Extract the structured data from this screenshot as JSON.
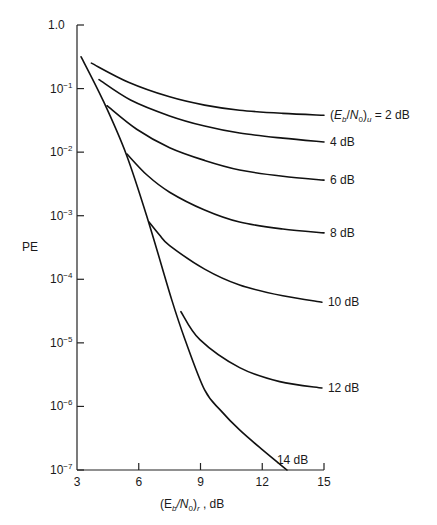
{
  "chart_data": {
    "type": "line",
    "title": "",
    "xlabel": "(E_b/N_0)_r , dB",
    "ylabel": "PE",
    "xlim": [
      3,
      15
    ],
    "ylim": [
      1e-07,
      1.0
    ],
    "yscale": "log",
    "grid": false,
    "legend_position": "inline labels at right end of curves",
    "x_ticks": [
      3,
      6,
      9,
      12,
      15
    ],
    "y_ticks": [
      {
        "value": 1.0,
        "label": "1.0"
      },
      {
        "value": 0.1,
        "label": "10",
        "exp": "−1"
      },
      {
        "value": 0.01,
        "label": "10",
        "exp": "−2"
      },
      {
        "value": 0.001,
        "label": "10",
        "exp": "−3"
      },
      {
        "value": 0.0001,
        "label": "10",
        "exp": "−4"
      },
      {
        "value": 1e-05,
        "label": "10",
        "exp": "−5"
      },
      {
        "value": 1e-06,
        "label": "10",
        "exp": "−6"
      },
      {
        "value": 1e-07,
        "label": "10",
        "exp": "−7"
      }
    ],
    "series": [
      {
        "name": "14 dB",
        "label": "14 dB",
        "label_pos": "above-end",
        "x": [
          3.2,
          4.3,
          5.4,
          6.45,
          7.6,
          8.25,
          9.2,
          10.0,
          10.9,
          12.0,
          13.2
        ],
        "log10_y": [
          -0.5,
          -1.21,
          -2.04,
          -3.07,
          -4.32,
          -4.95,
          -5.74,
          -6.07,
          -6.37,
          -6.68,
          -7.0
        ]
      },
      {
        "name": "2 dB",
        "label": "(E_b/N_0)_u = 2 dB",
        "label_pos": "right",
        "x": [
          3.7,
          5.5,
          7.5,
          9.2,
          10.9,
          13.0,
          15.0
        ],
        "log10_y": [
          -0.6,
          -0.9,
          -1.13,
          -1.26,
          -1.34,
          -1.39,
          -1.42
        ]
      },
      {
        "name": "4 dB",
        "label": "4 dB",
        "label_pos": "right",
        "x": [
          4.07,
          5.6,
          7.5,
          9.2,
          10.9,
          13.0,
          15.0
        ],
        "log10_y": [
          -0.86,
          -1.18,
          -1.43,
          -1.59,
          -1.7,
          -1.78,
          -1.84
        ]
      },
      {
        "name": "6 dB",
        "label": "6 dB",
        "label_pos": "right",
        "x": [
          4.46,
          5.9,
          7.5,
          9.2,
          10.9,
          13.0,
          15.0
        ],
        "log10_y": [
          -1.27,
          -1.64,
          -1.93,
          -2.13,
          -2.28,
          -2.38,
          -2.44
        ]
      },
      {
        "name": "8 dB",
        "label": "8 dB",
        "label_pos": "right",
        "x": [
          5.43,
          6.4,
          7.5,
          9.2,
          10.9,
          13.0,
          15.0
        ],
        "log10_y": [
          -2.03,
          -2.36,
          -2.63,
          -2.91,
          -3.1,
          -3.21,
          -3.27
        ]
      },
      {
        "name": "10 dB",
        "label": "10 dB",
        "label_pos": "right",
        "x": [
          6.5,
          7.0,
          7.5,
          9.2,
          10.9,
          13.0,
          14.9
        ],
        "log10_y": [
          -3.1,
          -3.3,
          -3.47,
          -3.84,
          -4.09,
          -4.26,
          -4.36
        ]
      },
      {
        "name": "12 dB",
        "label": "12 dB",
        "label_pos": "right",
        "x": [
          8.05,
          8.97,
          10.9,
          12.85,
          14.9
        ],
        "log10_y": [
          -4.51,
          -4.95,
          -5.39,
          -5.61,
          -5.71
        ]
      }
    ]
  },
  "labels": {
    "ylabel": "PE",
    "xlabel_prefix": "(E",
    "xlabel_sub_b": "b",
    "xlabel_slash": "/N",
    "xlabel_sub_0": "0",
    "xlabel_close": ")",
    "xlabel_sub_r": "r",
    "xlabel_suffix": " , dB"
  }
}
